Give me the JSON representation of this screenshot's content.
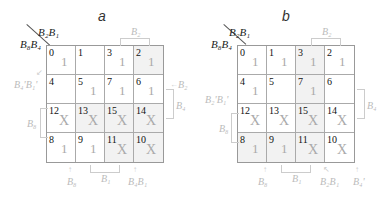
{
  "maps": [
    {
      "title": "a",
      "col_var": "B₂B₁",
      "row_var": "B₈B₄",
      "cells": [
        {
          "num": "0",
          "val": "1",
          "shade": false
        },
        {
          "num": "1",
          "val": "",
          "shade": false
        },
        {
          "num": "3",
          "val": "1",
          "shade": false
        },
        {
          "num": "2",
          "val": "1",
          "shade": true
        },
        {
          "num": "4",
          "val": "",
          "shade": false
        },
        {
          "num": "5",
          "val": "1",
          "shade": false
        },
        {
          "num": "7",
          "val": "1",
          "shade": false
        },
        {
          "num": "6",
          "val": "1",
          "shade": false
        },
        {
          "num": "12",
          "val": "X",
          "shade": false
        },
        {
          "num": "13",
          "val": "X",
          "shade": true
        },
        {
          "num": "15",
          "val": "X",
          "shade": true
        },
        {
          "num": "14",
          "val": "X",
          "shade": true
        },
        {
          "num": "8",
          "val": "1",
          "shade": false
        },
        {
          "num": "9",
          "val": "1",
          "shade": false
        },
        {
          "num": "11",
          "val": "X",
          "shade": true
        },
        {
          "num": "10",
          "val": "X",
          "shade": true
        }
      ],
      "labels": {
        "top": "B₂",
        "left_top": "B₄'B₁'",
        "left_mid": "B₈",
        "right_top": "B₂",
        "right_mid": "B₄",
        "bottom_1": "B₈",
        "bottom_2": "B₁",
        "bottom_3": "B₄B₁"
      }
    },
    {
      "title": "b",
      "col_var": "B₂B₁",
      "row_var": "B₈B₄",
      "cells": [
        {
          "num": "0",
          "val": "1",
          "shade": false
        },
        {
          "num": "1",
          "val": "1",
          "shade": false
        },
        {
          "num": "3",
          "val": "1",
          "shade": true
        },
        {
          "num": "2",
          "val": "1",
          "shade": false
        },
        {
          "num": "4",
          "val": "1",
          "shade": false
        },
        {
          "num": "5",
          "val": "",
          "shade": false
        },
        {
          "num": "7",
          "val": "1",
          "shade": true
        },
        {
          "num": "6",
          "val": "",
          "shade": false
        },
        {
          "num": "12",
          "val": "X",
          "shade": false
        },
        {
          "num": "13",
          "val": "X",
          "shade": false
        },
        {
          "num": "15",
          "val": "X",
          "shade": true
        },
        {
          "num": "14",
          "val": "X",
          "shade": false
        },
        {
          "num": "8",
          "val": "1",
          "shade": true
        },
        {
          "num": "9",
          "val": "1",
          "shade": true
        },
        {
          "num": "11",
          "val": "X",
          "shade": true
        },
        {
          "num": "10",
          "val": "X",
          "shade": false
        }
      ],
      "labels": {
        "top": "B₂",
        "left_top": "B₂'B₁'",
        "left_mid": "B₈",
        "right_mid": "B₄",
        "bottom_1": "B₈",
        "bottom_2": "B₁",
        "bottom_3": "B₂B₁",
        "bottom_4": "B₄'"
      }
    }
  ]
}
